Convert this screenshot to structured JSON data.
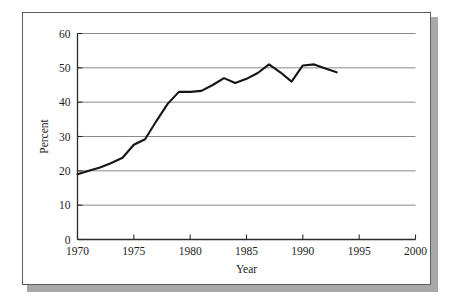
{
  "figure": {
    "frame_style": "rectangular border with drop shadow",
    "background_color": "#ffffff",
    "border_color": "#5d5d5d",
    "shadow_color": "#a8a8a8",
    "line_color": "#141414",
    "grid_color": "#8a8a8a"
  },
  "chart_data": {
    "type": "line",
    "title": "",
    "xlabel": "Year",
    "ylabel": "Percent",
    "xlim": [
      1970,
      2000
    ],
    "ylim": [
      0,
      60
    ],
    "xticks": [
      1970,
      1975,
      1980,
      1985,
      1990,
      1995,
      2000
    ],
    "xtick_labels": [
      "1970",
      "1975",
      "1980",
      "1985",
      "1990",
      "1995",
      "2000"
    ],
    "yticks": [
      0,
      10,
      20,
      30,
      40,
      50,
      60
    ],
    "ytick_labels": [
      "0",
      "10",
      "20",
      "30",
      "40",
      "50",
      "60"
    ],
    "grid": "horizontal",
    "legend": "none",
    "x": [
      1970,
      1971,
      1972,
      1973,
      1974,
      1975,
      1976,
      1977,
      1978,
      1979,
      1980,
      1981,
      1982,
      1983,
      1984,
      1985,
      1986,
      1987,
      1988,
      1989,
      1990,
      1991,
      1992,
      1993
    ],
    "series": [
      {
        "name": "Percent",
        "values": [
          19.0,
          20.0,
          21.0,
          22.3,
          23.8,
          27.6,
          29.2,
          34.5,
          39.5,
          43.0,
          43.0,
          43.3,
          45.0,
          47.0,
          45.6,
          46.8,
          48.5,
          51.0,
          48.7,
          46.0,
          50.7,
          51.0,
          49.8,
          48.7
        ]
      }
    ]
  }
}
